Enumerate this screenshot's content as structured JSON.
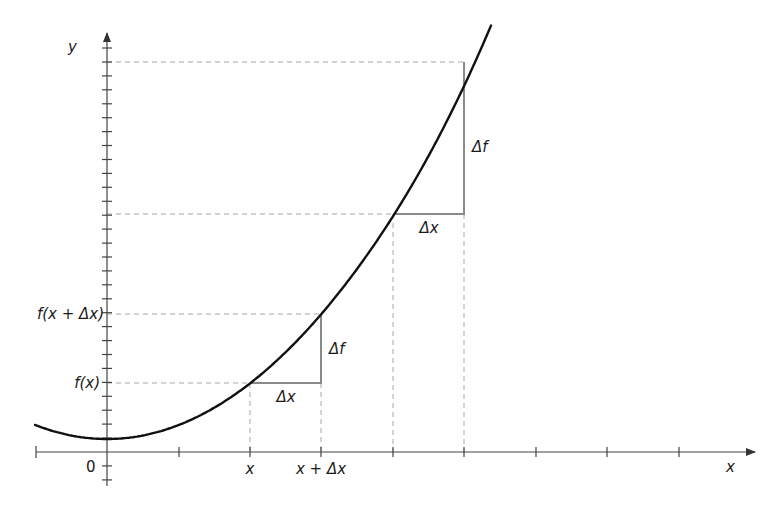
{
  "diagram": {
    "type": "function-increment-illustration",
    "axes": {
      "x_label": "x",
      "y_label": "y",
      "origin_label": "0"
    },
    "x_tick_labels": [
      {
        "text": "x",
        "tick_index": 2
      },
      {
        "text": "x + Δx",
        "tick_index": 3
      }
    ],
    "y_tick_labels": [
      {
        "text": "f(x)"
      },
      {
        "text": "f(x + Δx)"
      }
    ],
    "lower_triangle": {
      "dx_label": "Δx",
      "df_label": "Δf"
    },
    "upper_triangle": {
      "dx_label": "Δx",
      "df_label": "Δf"
    },
    "colors": {
      "curve": "#111111",
      "axis": "#444444",
      "triangle": "#8a8a8a",
      "dashed": "#a8a8a8",
      "text": "#1a1a1a"
    }
  }
}
